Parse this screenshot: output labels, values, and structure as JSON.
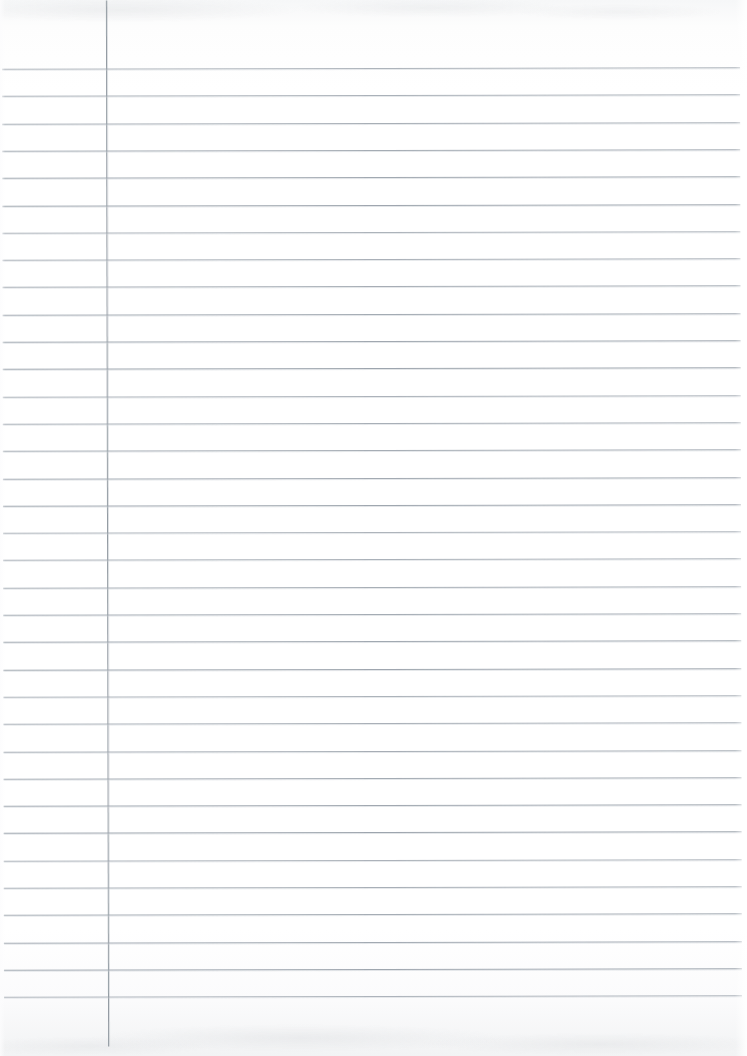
{
  "page": {
    "kind": "scanned-blank-ruled-notebook-page",
    "orientation": "portrait",
    "width_px": 747,
    "height_px": 1056,
    "paper_color": "#ffffff",
    "has_visible_text": false,
    "text_content": "",
    "annotations": []
  },
  "ruling": {
    "style": "wide-ruled-with-left-margin",
    "rule_color": "#9aa2ab",
    "rule_thickness_px": 1,
    "rule_spacing_px": 27.3,
    "first_rule_y_px": 68,
    "rule_count": 35,
    "rule_start_x_px": 3,
    "rule_end_x_px": 741,
    "header_space_px": 68
  },
  "margin_rule": {
    "present": true,
    "orientation": "vertical",
    "color": "#8f979f",
    "thickness_px": 1,
    "x_px": 107,
    "top_y_px": 0,
    "bottom_y_px": 1046
  },
  "columns": {
    "margin_column": {
      "label": "left margin column",
      "left_px": 0,
      "width_px": 107
    },
    "writing_column": {
      "label": "main writing area",
      "left_px": 108,
      "width_px": 633
    }
  },
  "scan_artifacts": {
    "top_band": {
      "present": true,
      "color": "#f2f3f4",
      "height_px": 26,
      "description": "faint gray mottling along the top scan edge"
    },
    "bottom_band": {
      "present": true,
      "color": "#f2f3f4",
      "height_px": 34,
      "description": "faint gray mottling along the bottom scan edge"
    },
    "skew_degrees": -0.12,
    "right_edge_falloff_px": 12
  }
}
